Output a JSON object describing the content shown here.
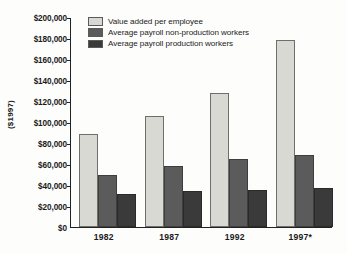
{
  "chart_data": {
    "type": "bar",
    "title": "",
    "subtitle": "",
    "xlabel": "",
    "ylabel": "($1997)",
    "categories": [
      "1982",
      "1987",
      "1992",
      "1997*"
    ],
    "series": [
      {
        "name": "Value added per employee",
        "color": "#d9d9d4",
        "values": [
          88500,
          106000,
          128000,
          178000
        ]
      },
      {
        "name": "Average payroll non-production workers",
        "color": "#5b5b5b",
        "values": [
          50000,
          58500,
          64500,
          68500
        ]
      },
      {
        "name": "Average payroll production workers",
        "color": "#3a3a3a",
        "values": [
          31000,
          34000,
          35000,
          37000
        ]
      }
    ],
    "ylim": [
      0,
      200000
    ],
    "ytick_values": [
      0,
      20000,
      40000,
      60000,
      80000,
      100000,
      120000,
      140000,
      160000,
      180000,
      200000
    ],
    "ytick_labels": [
      "$0",
      "$20,000",
      "$40,000",
      "$60,000",
      "$80,000",
      "$100,000",
      "$120,000",
      "$140,000",
      "$160,000",
      "$180,000",
      "$200,000"
    ],
    "grid": false,
    "legend_position": "top-left",
    "background_color": "#fdfdfb",
    "axis_color": "#222222"
  }
}
